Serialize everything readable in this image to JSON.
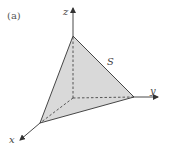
{
  "figure": {
    "panel_label": "(a)",
    "surface_label": "S",
    "axes": {
      "x_label": "x",
      "y_label": "y",
      "z_label": "z"
    },
    "colors": {
      "surface_fill": "#d9d9d9",
      "line": "#333333"
    }
  }
}
